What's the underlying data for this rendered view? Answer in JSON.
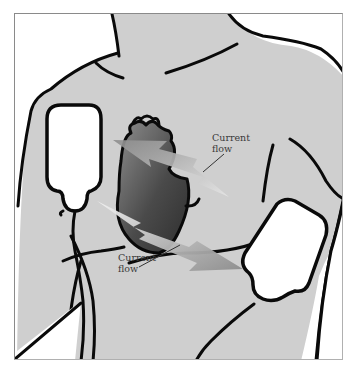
{
  "figure": {
    "colors": {
      "skin": "#cfcfcf",
      "outline": "#0a0a0a",
      "heart_dark": "#3c3c3c",
      "heart_light": "#8a8a8a",
      "arrow": "#9a9a9a",
      "paddle": "#ffffff",
      "frame": "#8a8a8a"
    },
    "labels": [
      {
        "id": "upper",
        "text": "Current\nflow"
      },
      {
        "id": "lower",
        "text": "Current\nflow"
      }
    ]
  }
}
